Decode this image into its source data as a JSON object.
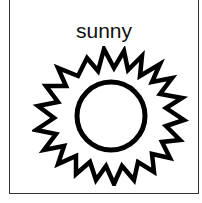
{
  "card": {
    "label": "sunny",
    "icon": "sun-icon"
  },
  "colors": {
    "stroke": "#000000",
    "border": "#333333",
    "background": "#ffffff"
  }
}
